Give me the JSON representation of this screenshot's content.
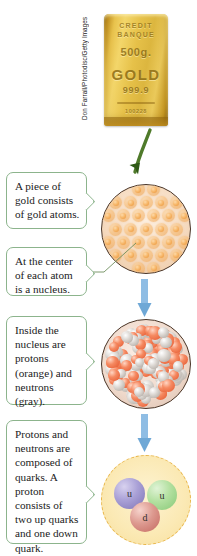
{
  "figure": {
    "credit": "Don Farrall/Photodisc/Getty Images",
    "gold_bar": {
      "brand_line1": "CREDIT",
      "brand_line2": "BANQUE",
      "weight": "500g.",
      "metal": "GOLD",
      "fineness": "999.9",
      "serial": "100228"
    },
    "callouts": [
      {
        "id": "gold-atoms",
        "text": "A piece of gold consists of gold atoms."
      },
      {
        "id": "nucleus",
        "text": "At the center of each atom is a nucleus."
      },
      {
        "id": "nucleons",
        "text": "Inside the nucleus are protons (orange) and neutrons (gray)."
      },
      {
        "id": "quarks",
        "text": "Protons and neutrons are composed of quarks. A proton consists of two up quarks and one down quark."
      }
    ],
    "quarks": [
      {
        "label": "u",
        "name": "up-quark-purple",
        "color": "#7d72b5"
      },
      {
        "label": "u",
        "name": "up-quark-green",
        "color": "#86c877"
      },
      {
        "label": "d",
        "name": "down-quark-red",
        "color": "#c4685f"
      }
    ],
    "legend_colors": {
      "proton": "#e4572e",
      "neutron": "#a9a29b",
      "gold_atom": "#f7b96d",
      "callout_border": "#8cb48c",
      "arrow_blue": "#7fb3e0",
      "arrow_green": "#4f7a2a",
      "quark_boundary": "#e9b64a"
    }
  }
}
